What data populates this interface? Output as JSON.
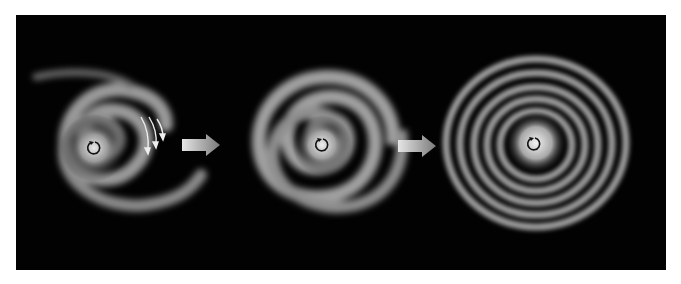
{
  "figure": {
    "background": "#020202",
    "stages": [
      {
        "id": "stage-1",
        "name": "loose two-armed spiral",
        "has_motion_arrows": true,
        "rotation": "counterclockwise"
      },
      {
        "id": "stage-2",
        "name": "tighter wound spiral",
        "has_motion_arrows": false,
        "rotation": "counterclockwise"
      },
      {
        "id": "stage-3",
        "name": "tightly wound ring-like spiral",
        "has_motion_arrows": false,
        "rotation": "counterclockwise"
      }
    ],
    "transition_arrows": 2,
    "colors": {
      "galaxy_glow": "#d8d8d8",
      "arm": "#a8a8a8",
      "arrow_light": "#e6e6e6",
      "arrow_dark": "#7a7a7a",
      "rotation_icon": "#111111"
    }
  }
}
